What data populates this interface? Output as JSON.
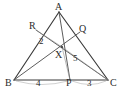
{
  "figure": {
    "type": "geometry-diagram",
    "background_color": "#ffffff",
    "stroke_color": "#3a3a3a",
    "text_color": "#2b2b2b"
  },
  "points": {
    "A": {
      "label": "A",
      "x": 59,
      "y": 12
    },
    "B": {
      "label": "B",
      "x": 14,
      "y": 80
    },
    "C": {
      "label": "C",
      "x": 108,
      "y": 80
    },
    "P": {
      "label": "P",
      "x": 70,
      "y": 80
    },
    "Q": {
      "label": "Q",
      "x": 80,
      "y": 32
    },
    "R": {
      "label": "R",
      "x": 36,
      "y": 30
    },
    "X": {
      "label": "X",
      "x": 62,
      "y": 47
    }
  },
  "segments": [
    {
      "name": "side-AB",
      "from": "A",
      "to": "B"
    },
    {
      "name": "side-AC",
      "from": "A",
      "to": "C"
    },
    {
      "name": "side-BC",
      "from": "B",
      "to": "C"
    },
    {
      "name": "cevian-AP",
      "from": "A",
      "to": "P"
    },
    {
      "name": "cevian-BQ",
      "from": "B",
      "to": "Q"
    },
    {
      "name": "cevian-CR",
      "from": "C",
      "to": "R"
    }
  ],
  "measures": [
    {
      "name": "region-area-2",
      "value": "2",
      "x": 42,
      "y": 42
    },
    {
      "name": "region-area-5",
      "value": "5",
      "x": 76,
      "y": 59
    },
    {
      "name": "segment-BP-length",
      "value": "4",
      "x": 39,
      "y": 84
    },
    {
      "name": "segment-PC-length",
      "value": "3",
      "x": 90,
      "y": 84
    }
  ]
}
